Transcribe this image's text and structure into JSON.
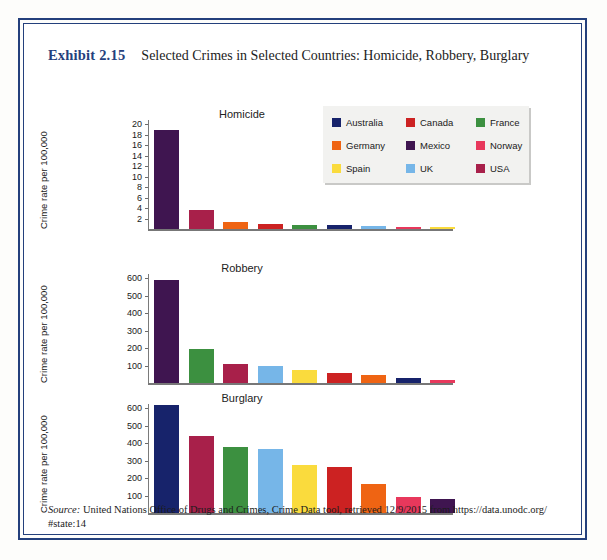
{
  "exhibit": {
    "label": "Exhibit 2.15",
    "title": "Selected Crimes in Selected Countries: Homicide, Robbery, Burglary"
  },
  "legend": {
    "items": [
      {
        "label": "Australia",
        "color": "#17236b"
      },
      {
        "label": "Canada",
        "color": "#cc2222"
      },
      {
        "label": "France",
        "color": "#3c9040"
      },
      {
        "label": "Germany",
        "color": "#ef6413"
      },
      {
        "label": "Mexico",
        "color": "#3f1550"
      },
      {
        "label": "Norway",
        "color": "#e8385c"
      },
      {
        "label": "Spain",
        "color": "#fadb3d"
      },
      {
        "label": "UK",
        "color": "#76b6e8"
      },
      {
        "label": "USA",
        "color": "#a8204a"
      }
    ]
  },
  "source": {
    "prefix": "Source:",
    "text": " United Nations Office of Drugs and Crimes, Crime Data tool, retrieved 12/9/2015 from https://data.unodc.org/",
    "line2": "#state:14"
  },
  "chart_data": [
    {
      "type": "bar",
      "title": "Homicide",
      "xlabel": "",
      "ylabel": "Crime rate per 100,000",
      "ylim": [
        0,
        20
      ],
      "yticks": [
        2,
        4,
        6,
        8,
        10,
        12,
        14,
        16,
        18,
        20
      ],
      "grid": false,
      "legend_position": "top-right",
      "categories": [
        "Mexico",
        "USA",
        "Germany",
        "Canada",
        "France",
        "Australia",
        "UK",
        "Norway",
        "Spain"
      ],
      "values": [
        18.9,
        3.6,
        1.3,
        1.0,
        0.8,
        0.7,
        0.6,
        0.4,
        0.3
      ],
      "colors": [
        "#3f1550",
        "#a8204a",
        "#ef6413",
        "#cc2222",
        "#3c9040",
        "#17236b",
        "#76b6e8",
        "#e8385c",
        "#fadb3d"
      ]
    },
    {
      "type": "bar",
      "title": "Robbery",
      "xlabel": "",
      "ylabel": "Crime rate per 100,000",
      "ylim": [
        0,
        600
      ],
      "yticks": [
        100,
        200,
        300,
        400,
        500,
        600
      ],
      "grid": false,
      "legend_position": "none",
      "categories": [
        "Mexico",
        "France",
        "USA",
        "UK",
        "Spain",
        "Canada",
        "Germany",
        "Australia",
        "Norway"
      ],
      "values": [
        588,
        195,
        107,
        98,
        75,
        55,
        46,
        28,
        20
      ],
      "colors": [
        "#3f1550",
        "#3c9040",
        "#a8204a",
        "#76b6e8",
        "#fadb3d",
        "#cc2222",
        "#ef6413",
        "#17236b",
        "#e8385c"
      ]
    },
    {
      "type": "bar",
      "title": "Burglary",
      "xlabel": "",
      "ylabel": "Crime rate per 100,000",
      "ylim": [
        0,
        600
      ],
      "yticks": [
        100,
        200,
        300,
        400,
        500,
        600
      ],
      "grid": false,
      "legend_position": "none",
      "categories": [
        "Australia",
        "USA",
        "France",
        "UK",
        "Spain",
        "Canada",
        "Germany",
        "Norway",
        "Mexico"
      ],
      "values": [
        618,
        440,
        378,
        365,
        275,
        265,
        168,
        92,
        80
      ],
      "colors": [
        "#17236b",
        "#a8204a",
        "#3c9040",
        "#76b6e8",
        "#fadb3d",
        "#cc2222",
        "#ef6413",
        "#e8385c",
        "#3f1550"
      ]
    }
  ]
}
